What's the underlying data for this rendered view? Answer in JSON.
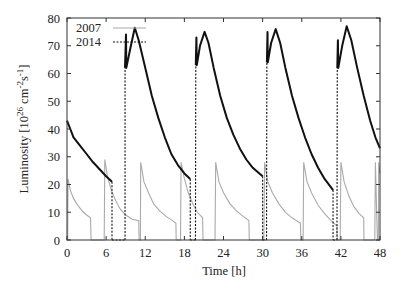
{
  "chart_data": {
    "type": "line",
    "title": "",
    "xlabel": "Time [h]",
    "ylabel": "Luminosity [10^26 cm^-2 s^-1]",
    "ylabel_parts": {
      "main": "Luminosity [10",
      "exp1": "26",
      "mid": " cm",
      "exp2": "-2",
      "mid2": "s",
      "exp3": "-1",
      "end": "]"
    },
    "xlim": [
      0,
      48
    ],
    "ylim": [
      0,
      80
    ],
    "xticks": [
      0,
      6,
      12,
      18,
      24,
      30,
      36,
      42,
      48
    ],
    "yticks": [
      0,
      10,
      20,
      30,
      40,
      50,
      60,
      70,
      80
    ],
    "grid": false,
    "legend_position": "upper-left",
    "series": [
      {
        "name": "2007",
        "color": "#aaaaaa",
        "style": "solid",
        "points": [
          [
            0.0,
            0
          ],
          [
            0.1,
            0
          ],
          [
            0.15,
            22
          ],
          [
            0.5,
            18
          ],
          [
            1.0,
            15
          ],
          [
            1.5,
            13
          ],
          [
            2.0,
            11.5
          ],
          [
            2.5,
            10
          ],
          [
            3.0,
            9
          ],
          [
            3.6,
            8
          ],
          [
            3.7,
            0
          ],
          [
            5.7,
            0
          ],
          [
            5.8,
            29
          ],
          [
            6.2,
            23
          ],
          [
            6.8,
            18
          ],
          [
            7.5,
            14
          ],
          [
            8.2,
            11
          ],
          [
            9.0,
            9
          ],
          [
            10.0,
            7.5
          ],
          [
            11.0,
            7
          ],
          [
            11.05,
            0
          ],
          [
            11.25,
            0
          ],
          [
            11.3,
            28
          ],
          [
            11.8,
            21
          ],
          [
            12.5,
            17
          ],
          [
            13.3,
            13
          ],
          [
            14.2,
            10.5
          ],
          [
            15.2,
            8.5
          ],
          [
            16.2,
            7
          ],
          [
            16.7,
            6
          ],
          [
            16.75,
            0
          ],
          [
            17.4,
            0
          ],
          [
            17.5,
            28
          ],
          [
            18.0,
            22
          ],
          [
            18.6,
            17
          ],
          [
            19.3,
            13
          ],
          [
            20.0,
            10
          ],
          [
            20.8,
            8
          ],
          [
            20.85,
            0
          ],
          [
            22.7,
            0
          ],
          [
            22.8,
            28
          ],
          [
            23.3,
            21
          ],
          [
            24.0,
            17
          ],
          [
            25.0,
            13
          ],
          [
            26.0,
            10.5
          ],
          [
            27.0,
            8.5
          ],
          [
            27.9,
            7
          ],
          [
            27.95,
            0
          ],
          [
            30.2,
            0
          ],
          [
            30.3,
            28
          ],
          [
            30.8,
            21
          ],
          [
            31.5,
            17
          ],
          [
            32.5,
            13
          ],
          [
            33.5,
            10
          ],
          [
            34.5,
            8
          ],
          [
            35.8,
            6
          ],
          [
            35.85,
            0
          ],
          [
            36.2,
            0
          ],
          [
            36.3,
            28
          ],
          [
            36.8,
            21
          ],
          [
            37.5,
            17
          ],
          [
            38.5,
            12.5
          ],
          [
            39.5,
            9.5
          ],
          [
            40.5,
            7
          ],
          [
            41.4,
            5
          ],
          [
            41.45,
            0
          ],
          [
            41.9,
            0
          ],
          [
            42.0,
            28
          ],
          [
            42.5,
            21
          ],
          [
            43.2,
            16
          ],
          [
            44.0,
            12
          ],
          [
            44.8,
            9.5
          ],
          [
            45.5,
            8
          ],
          [
            45.55,
            0
          ],
          [
            47.2,
            0
          ],
          [
            47.3,
            28
          ],
          [
            47.6,
            0
          ],
          [
            47.75,
            0
          ],
          [
            47.8,
            28
          ],
          [
            48.0,
            24
          ]
        ]
      },
      {
        "name": "2014",
        "color": "#111111",
        "style": "solid-with-dashed-fill-transitions",
        "points": [
          [
            0.0,
            43
          ],
          [
            0.5,
            40
          ],
          [
            1.0,
            37
          ],
          [
            2.0,
            34
          ],
          [
            3.0,
            31
          ],
          [
            4.0,
            28
          ],
          [
            5.0,
            25.5
          ],
          [
            6.0,
            23
          ],
          [
            6.9,
            21
          ],
          [
            6.9,
            0
          ],
          [
            8.9,
            0
          ],
          [
            8.9,
            62
          ],
          [
            9.05,
            74
          ],
          [
            9.1,
            62
          ],
          [
            9.7,
            69
          ],
          [
            10.4,
            76.5
          ],
          [
            11.0,
            72
          ],
          [
            12.0,
            62
          ],
          [
            13.0,
            52
          ],
          [
            14.0,
            44
          ],
          [
            15.0,
            37
          ],
          [
            16.0,
            31
          ],
          [
            17.0,
            27
          ],
          [
            18.0,
            24
          ],
          [
            18.9,
            22
          ],
          [
            18.9,
            0
          ],
          [
            19.7,
            0
          ],
          [
            19.75,
            63
          ],
          [
            19.85,
            73
          ],
          [
            19.9,
            63
          ],
          [
            20.4,
            70
          ],
          [
            21.1,
            75
          ],
          [
            21.7,
            71
          ],
          [
            22.5,
            62
          ],
          [
            23.5,
            52
          ],
          [
            24.5,
            44
          ],
          [
            25.5,
            38
          ],
          [
            26.5,
            33
          ],
          [
            27.5,
            29
          ],
          [
            28.5,
            26
          ],
          [
            29.5,
            24
          ],
          [
            30.0,
            23
          ],
          [
            30.0,
            0
          ],
          [
            30.6,
            0
          ],
          [
            30.65,
            64
          ],
          [
            30.75,
            75
          ],
          [
            30.8,
            64
          ],
          [
            31.3,
            71
          ],
          [
            32.0,
            76
          ],
          [
            32.7,
            71
          ],
          [
            33.5,
            62
          ],
          [
            34.5,
            52
          ],
          [
            35.5,
            44
          ],
          [
            36.5,
            37
          ],
          [
            37.5,
            31
          ],
          [
            38.5,
            26
          ],
          [
            39.5,
            22
          ],
          [
            40.8,
            18
          ],
          [
            40.8,
            0
          ],
          [
            41.4,
            0
          ],
          [
            41.45,
            62
          ],
          [
            41.55,
            72
          ],
          [
            41.6,
            62
          ],
          [
            42.2,
            70
          ],
          [
            42.9,
            77
          ],
          [
            43.6,
            72
          ],
          [
            44.5,
            62
          ],
          [
            45.5,
            52
          ],
          [
            46.5,
            43
          ],
          [
            47.3,
            37
          ],
          [
            48.0,
            33
          ]
        ]
      }
    ]
  }
}
